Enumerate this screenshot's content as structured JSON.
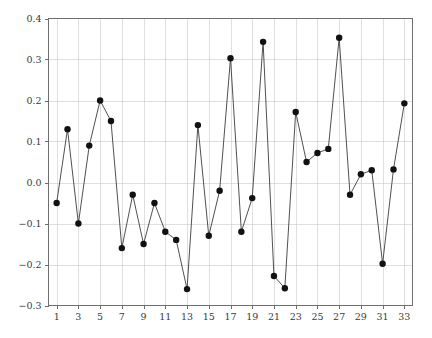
{
  "chart_data": {
    "type": "line",
    "title": "",
    "subtitle": "",
    "xlabel": "",
    "ylabel": "",
    "xlim": [
      0.25,
      33.75
    ],
    "ylim": [
      -0.3,
      0.4
    ],
    "grid": true,
    "legend": null,
    "legend_position": "none",
    "marker": "filled-circle",
    "line_color": "#3c3c3c",
    "marker_color": "#111111",
    "grid_color": "#c9c9c9",
    "axis_color": "#6e6e6e",
    "background_color": "#ffffff",
    "x": [
      1,
      2,
      3,
      4,
      5,
      6,
      7,
      8,
      9,
      10,
      11,
      12,
      13,
      14,
      15,
      16,
      17,
      18,
      19,
      20,
      21,
      22,
      23,
      24,
      25,
      26,
      27,
      28,
      29,
      30,
      31,
      32,
      33
    ],
    "values": [
      -0.05,
      0.13,
      -0.1,
      0.09,
      0.2,
      0.15,
      -0.16,
      -0.03,
      -0.15,
      -0.05,
      -0.12,
      -0.14,
      -0.26,
      0.14,
      -0.13,
      -0.02,
      0.303,
      -0.12,
      -0.038,
      0.343,
      -0.228,
      -0.258,
      0.172,
      0.05,
      0.072,
      0.082,
      0.353,
      -0.03,
      0.02,
      0.03,
      -0.198,
      0.032,
      0.193
    ],
    "xticks": [
      1,
      3,
      5,
      7,
      9,
      11,
      13,
      15,
      17,
      19,
      21,
      23,
      25,
      27,
      29,
      31,
      33
    ],
    "xticklabels": [
      "1",
      "3",
      "5",
      "7",
      "9",
      "11",
      "13",
      "15",
      "17",
      "19",
      "21",
      "23",
      "25",
      "27",
      "29",
      "31",
      "33"
    ],
    "yticks": [
      -0.3,
      -0.2,
      -0.1,
      0.0,
      0.1,
      0.2,
      0.3,
      0.4
    ],
    "yticklabels": [
      "-0.3",
      "-0.2",
      "-0.1",
      "0.0",
      "0.1",
      "0.2",
      "0.3",
      "0.4"
    ]
  }
}
